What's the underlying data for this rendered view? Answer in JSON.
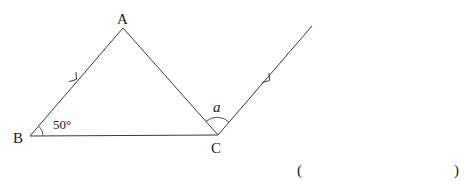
{
  "diagram": {
    "points": {
      "A": {
        "label": "A",
        "x": 123,
        "y": 28
      },
      "B": {
        "label": "B",
        "x": 30,
        "y": 136
      },
      "C": {
        "label": "C",
        "x": 218,
        "y": 135
      }
    },
    "ray_end": {
      "x": 312,
      "y": 26
    },
    "angle_B": {
      "label": "50°"
    },
    "angle_C": {
      "label": "a"
    },
    "answer_bracket": {
      "open": "(",
      "close": ")"
    }
  },
  "colors": {
    "stroke": "#3a3a3a",
    "text": "#1a1a1a",
    "background": "#ffffff"
  }
}
